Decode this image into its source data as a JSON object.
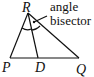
{
  "diagram": {
    "type": "triangle-angle-bisector",
    "vertices": {
      "R": {
        "label": "R",
        "x": 28,
        "y": 13
      },
      "P": {
        "label": "P",
        "x": 10,
        "y": 58
      },
      "Q": {
        "label": "Q",
        "x": 79,
        "y": 58
      },
      "D": {
        "label": "D",
        "x": 38,
        "y": 58
      }
    },
    "annotation": {
      "line1": "angle",
      "line2": "bisector"
    },
    "colors": {
      "stroke": "#111111",
      "background": "#ffffff"
    }
  }
}
